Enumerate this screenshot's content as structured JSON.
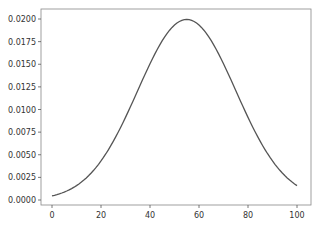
{
  "chart_data": {
    "type": "line",
    "title": "",
    "xlabel": "",
    "ylabel": "",
    "xlim": [
      -5,
      105
    ],
    "ylim": [
      -0.0005,
      0.021
    ],
    "grid": false,
    "legend": null,
    "x_ticks": [
      "0",
      "20",
      "40",
      "60",
      "80",
      "100"
    ],
    "x_tick_values": [
      0,
      20,
      40,
      60,
      80,
      100
    ],
    "y_ticks": [
      "0.0000",
      "0.0025",
      "0.0050",
      "0.0075",
      "0.0100",
      "0.0125",
      "0.0150",
      "0.0175",
      "0.0200"
    ],
    "y_tick_values": [
      0,
      0.0025,
      0.005,
      0.0075,
      0.01,
      0.0125,
      0.015,
      0.0175,
      0.02
    ],
    "series": [
      {
        "name": "density",
        "color": "#555555",
        "description": "Gaussian-shaped curve, mean approx 55, sd approx 20",
        "x": [
          0,
          5,
          10,
          15,
          20,
          25,
          30,
          35,
          40,
          45,
          50,
          55,
          60,
          65,
          70,
          75,
          80,
          85,
          90,
          95,
          100
        ],
        "y": [
          0.00046,
          0.00088,
          0.00159,
          0.0027,
          0.00433,
          0.00648,
          0.00913,
          0.01209,
          0.01506,
          0.0176,
          0.01936,
          0.01995,
          0.01936,
          0.0176,
          0.01506,
          0.01209,
          0.00913,
          0.00648,
          0.00433,
          0.0027,
          0.00159
        ]
      }
    ]
  }
}
